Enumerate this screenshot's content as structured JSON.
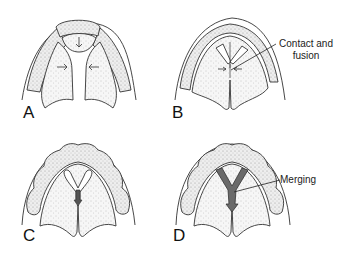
{
  "figure": {
    "panels": [
      {
        "id": "A",
        "label": "A",
        "annotation": null
      },
      {
        "id": "B",
        "label": "B",
        "annotation": "Contact and fusion",
        "annotation_lines": [
          "Contact and",
          "fusion"
        ]
      },
      {
        "id": "C",
        "label": "C",
        "annotation": null
      },
      {
        "id": "D",
        "label": "D",
        "annotation": "Merging"
      }
    ],
    "colors": {
      "line": "#333333",
      "stipple_fill": "#efefef",
      "ridge_fill": "#f4f4f4",
      "septum_fill": "#6a6a6a"
    }
  }
}
